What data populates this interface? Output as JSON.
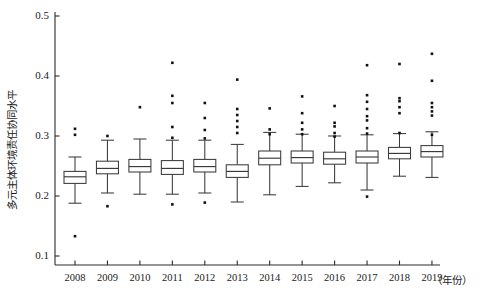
{
  "chart_data": {
    "type": "box",
    "title": "",
    "subtitle": "",
    "xlabel": "（年份）",
    "ylabel": "多元主体环境责任协同水平",
    "grid": false,
    "legend": "none",
    "xlim": [
      2007.5,
      2019.5
    ],
    "ylim": [
      0.1,
      0.5
    ],
    "ytick_labels": [
      "0.1",
      "0.2",
      "0.3",
      "0.4",
      "0.5"
    ],
    "ytick_values": [
      0.1,
      0.2,
      0.3,
      0.4,
      0.5
    ],
    "categories": [
      "2008",
      "2009",
      "2010",
      "2011",
      "2012",
      "2013",
      "2014",
      "2015",
      "2016",
      "2017",
      "2018",
      "2019"
    ],
    "boxes": [
      {
        "category": "2008",
        "whisker_low": 0.188,
        "q1": 0.221,
        "median": 0.232,
        "q3": 0.241,
        "whisker_high": 0.265,
        "outliers": [
          0.312,
          0.302,
          0.133
        ]
      },
      {
        "category": "2009",
        "whisker_low": 0.205,
        "q1": 0.237,
        "median": 0.246,
        "q3": 0.258,
        "whisker_high": 0.293,
        "outliers": [
          0.3,
          0.183
        ]
      },
      {
        "category": "2010",
        "whisker_low": 0.203,
        "q1": 0.24,
        "median": 0.249,
        "q3": 0.261,
        "whisker_high": 0.295,
        "outliers": [
          0.348
        ]
      },
      {
        "category": "2011",
        "whisker_low": 0.203,
        "q1": 0.236,
        "median": 0.246,
        "q3": 0.259,
        "whisker_high": 0.293,
        "outliers": [
          0.422,
          0.367,
          0.355,
          0.315,
          0.297,
          0.186
        ]
      },
      {
        "category": "2012",
        "whisker_low": 0.205,
        "q1": 0.24,
        "median": 0.249,
        "q3": 0.261,
        "whisker_high": 0.293,
        "outliers": [
          0.355,
          0.33,
          0.31,
          0.296,
          0.189
        ]
      },
      {
        "category": "2013",
        "whisker_low": 0.19,
        "q1": 0.231,
        "median": 0.241,
        "q3": 0.252,
        "whisker_high": 0.286,
        "outliers": [
          0.394,
          0.345,
          0.335,
          0.325,
          0.315,
          0.305
        ]
      },
      {
        "category": "2014",
        "whisker_low": 0.202,
        "q1": 0.252,
        "median": 0.263,
        "q3": 0.275,
        "whisker_high": 0.306,
        "outliers": [
          0.346,
          0.311,
          0.303
        ]
      },
      {
        "category": "2015",
        "whisker_low": 0.216,
        "q1": 0.255,
        "median": 0.264,
        "q3": 0.275,
        "whisker_high": 0.303,
        "outliers": [
          0.366,
          0.338,
          0.322,
          0.311,
          0.303
        ]
      },
      {
        "category": "2016",
        "whisker_low": 0.222,
        "q1": 0.253,
        "median": 0.262,
        "q3": 0.273,
        "whisker_high": 0.3,
        "outliers": [
          0.35,
          0.322,
          0.316,
          0.305,
          0.299
        ]
      },
      {
        "category": "2017",
        "whisker_low": 0.21,
        "q1": 0.255,
        "median": 0.265,
        "q3": 0.275,
        "whisker_high": 0.302,
        "outliers": [
          0.418,
          0.368,
          0.357,
          0.345,
          0.333,
          0.326,
          0.313,
          0.304,
          0.199
        ]
      },
      {
        "category": "2018",
        "whisker_low": 0.233,
        "q1": 0.262,
        "median": 0.271,
        "q3": 0.281,
        "whisker_high": 0.304,
        "outliers": [
          0.42,
          0.363,
          0.358,
          0.348,
          0.338,
          0.305
        ]
      },
      {
        "category": "2019",
        "whisker_low": 0.231,
        "q1": 0.265,
        "median": 0.274,
        "q3": 0.284,
        "whisker_high": 0.307,
        "outliers": [
          0.437,
          0.392,
          0.355,
          0.348,
          0.341,
          0.334,
          0.302
        ]
      }
    ]
  },
  "colors": {
    "axis": "#2b2b2b",
    "box_stroke": "#3a3a3a",
    "box_fill": "#ffffff",
    "outlier": "#111111",
    "background": "#ffffff"
  }
}
